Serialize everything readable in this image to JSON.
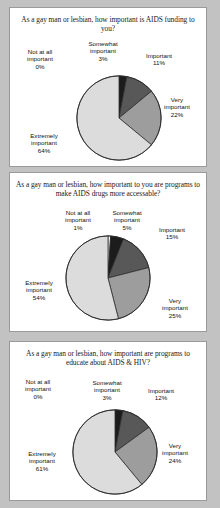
{
  "document": {
    "background_color": "#c2c2c2",
    "panel_background": "#ffffff",
    "panel_border_color": "#9a9a9a"
  },
  "palette": {
    "not_at_all": "#ffffff",
    "somewhat": "#1c1c1c",
    "important": "#585858",
    "very": "#9d9d9d",
    "extremely": "#dcdcdc",
    "outline": "#2b2b2b"
  },
  "charts": [
    {
      "id": "aids-funding",
      "title": "As a gay man or lesbian, how important is AIDS funding to you?",
      "labels": {
        "not_at_all": {
          "name": "Not at all important",
          "line1": "Not at all",
          "line2": "important",
          "pct": "0%"
        },
        "somewhat": {
          "name": "Somewhat important",
          "line1": "Somewhat",
          "line2": "important",
          "pct": "3%"
        },
        "important": {
          "name": "Important",
          "line1": "Important",
          "line2": "",
          "pct": "11%"
        },
        "very": {
          "name": "Very important",
          "line1": "Very",
          "line2": "important",
          "pct": "22%"
        },
        "extremely": {
          "name": "Extremely important",
          "line1": "Extremely",
          "line2": "important",
          "pct": "64%"
        }
      },
      "chart_data": {
        "type": "pie",
        "title": "As a gay man or lesbian, how important is AIDS funding to you?",
        "categories": [
          "Not at all important",
          "Somewhat important",
          "Important",
          "Very important",
          "Extremely important"
        ],
        "values": [
          0,
          3,
          11,
          22,
          64
        ],
        "value_labels": [
          "0%",
          "3%",
          "11%",
          "22%",
          "64%"
        ],
        "units": "percent",
        "total": 100,
        "colors": [
          "#ffffff",
          "#1c1c1c",
          "#585858",
          "#9d9d9d",
          "#dcdcdc"
        ],
        "legend": "none",
        "labels_position": "outside"
      }
    },
    {
      "id": "aids-drugs-accessable",
      "title": "As a gay man or lesbian, how important to you are programs to make AIDS drugs more accessable?",
      "labels": {
        "not_at_all": {
          "name": "Not at all important",
          "line1": "Not at all",
          "line2": "important",
          "pct": "1%"
        },
        "somewhat": {
          "name": "Somewhat important",
          "line1": "Somewhat",
          "line2": "important",
          "pct": "5%"
        },
        "important": {
          "name": "Important",
          "line1": "Important",
          "line2": "",
          "pct": "15%"
        },
        "very": {
          "name": "Very important",
          "line1": "Very",
          "line2": "important",
          "pct": "25%"
        },
        "extremely": {
          "name": "Extremely important",
          "line1": "Extremely",
          "line2": "important",
          "pct": "54%"
        }
      },
      "chart_data": {
        "type": "pie",
        "title": "As a gay man or lesbian, how important to you are programs to make AIDS drugs more accessable?",
        "categories": [
          "Not at all important",
          "Somewhat important",
          "Important",
          "Very important",
          "Extremely important"
        ],
        "values": [
          1,
          5,
          15,
          25,
          54
        ],
        "value_labels": [
          "1%",
          "5%",
          "15%",
          "25%",
          "54%"
        ],
        "units": "percent",
        "total": 100,
        "colors": [
          "#ffffff",
          "#1c1c1c",
          "#585858",
          "#9d9d9d",
          "#dcdcdc"
        ],
        "legend": "none",
        "labels_position": "outside"
      }
    },
    {
      "id": "educate-aids-hiv",
      "title": "As a gay man or lesbian, how important are programs to educate about AIDS & HIV?",
      "labels": {
        "not_at_all": {
          "name": "Not at all important",
          "line1": "Not at all",
          "line2": "important",
          "pct": "0%"
        },
        "somewhat": {
          "name": "Somewhat important",
          "line1": "Somewhat",
          "line2": "important",
          "pct": "3%"
        },
        "important": {
          "name": "Important",
          "line1": "Important",
          "line2": "",
          "pct": "12%"
        },
        "very": {
          "name": "Very important",
          "line1": "Very",
          "line2": "important",
          "pct": "24%"
        },
        "extremely": {
          "name": "Extremely important",
          "line1": "Extremely",
          "line2": "important",
          "pct": "61%"
        }
      },
      "chart_data": {
        "type": "pie",
        "title": "As a gay man or lesbian, how important are programs to educate about AIDS & HIV?",
        "categories": [
          "Not at all important",
          "Somewhat important",
          "Important",
          "Very important",
          "Extremely important"
        ],
        "values": [
          0,
          3,
          12,
          24,
          61
        ],
        "value_labels": [
          "0%",
          "3%",
          "12%",
          "24%",
          "61%"
        ],
        "units": "percent",
        "total": 100,
        "colors": [
          "#ffffff",
          "#1c1c1c",
          "#585858",
          "#9d9d9d",
          "#dcdcdc"
        ],
        "legend": "none",
        "labels_position": "outside"
      }
    }
  ]
}
